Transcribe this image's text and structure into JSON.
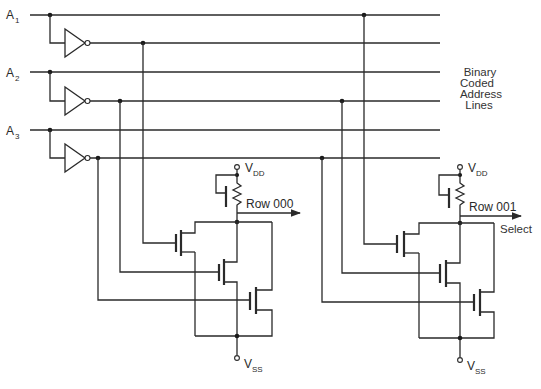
{
  "diagram": {
    "type": "decoder-circuit",
    "inputs": [
      {
        "name": "A",
        "sub": "1"
      },
      {
        "name": "A",
        "sub": "2"
      },
      {
        "name": "A",
        "sub": "3"
      }
    ],
    "side_label": [
      "Binary",
      "Coded",
      "Address",
      "Lines"
    ],
    "rows": [
      {
        "output_label": "Row 000",
        "supply_top": {
          "name": "V",
          "sub": "DD"
        },
        "supply_bottom": {
          "name": "V",
          "sub": "SS"
        }
      },
      {
        "output_label": "Row 001",
        "extra_label": "Select",
        "supply_top": {
          "name": "V",
          "sub": "DD"
        },
        "supply_bottom": {
          "name": "V",
          "sub": "SS"
        }
      }
    ]
  }
}
